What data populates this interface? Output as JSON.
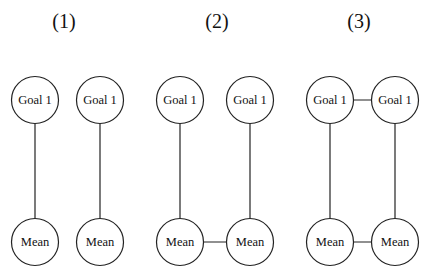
{
  "figure": {
    "panels": [
      {
        "label": "(1)",
        "label_x": 64,
        "nodes": [
          {
            "id": "p1-goal-a",
            "text": "Goal 1",
            "cx": 35,
            "cy": 100
          },
          {
            "id": "p1-goal-b",
            "text": "Goal 1",
            "cx": 100,
            "cy": 100
          },
          {
            "id": "p1-mean-a",
            "text": "Mean",
            "cx": 35,
            "cy": 242
          },
          {
            "id": "p1-mean-b",
            "text": "Mean",
            "cx": 100,
            "cy": 242
          }
        ],
        "edges": [
          [
            "p1-goal-a",
            "p1-mean-a"
          ],
          [
            "p1-goal-b",
            "p1-mean-b"
          ]
        ]
      },
      {
        "label": "(2)",
        "label_x": 217,
        "nodes": [
          {
            "id": "p2-goal-a",
            "text": "Goal 1",
            "cx": 180,
            "cy": 100
          },
          {
            "id": "p2-goal-b",
            "text": "Goal 1",
            "cx": 250,
            "cy": 100
          },
          {
            "id": "p2-mean-a",
            "text": "Mean",
            "cx": 180,
            "cy": 242
          },
          {
            "id": "p2-mean-b",
            "text": "Mean",
            "cx": 250,
            "cy": 242
          }
        ],
        "edges": [
          [
            "p2-goal-a",
            "p2-mean-a"
          ],
          [
            "p2-goal-b",
            "p2-mean-b"
          ],
          [
            "p2-mean-a",
            "p2-mean-b"
          ]
        ]
      },
      {
        "label": "(3)",
        "label_x": 359,
        "nodes": [
          {
            "id": "p3-goal-a",
            "text": "Goal 1",
            "cx": 330,
            "cy": 100
          },
          {
            "id": "p3-goal-b",
            "text": "Goal 1",
            "cx": 395,
            "cy": 100
          },
          {
            "id": "p3-mean-a",
            "text": "Mean",
            "cx": 330,
            "cy": 242
          },
          {
            "id": "p3-mean-b",
            "text": "Mean",
            "cx": 395,
            "cy": 242
          }
        ],
        "edges": [
          [
            "p3-goal-a",
            "p3-mean-a"
          ],
          [
            "p3-goal-b",
            "p3-mean-b"
          ],
          [
            "p3-mean-a",
            "p3-mean-b"
          ],
          [
            "p3-goal-a",
            "p3-goal-b"
          ]
        ]
      }
    ],
    "node_radius": 23.5,
    "stroke_color": "#222222",
    "stroke_width": 1.2
  }
}
